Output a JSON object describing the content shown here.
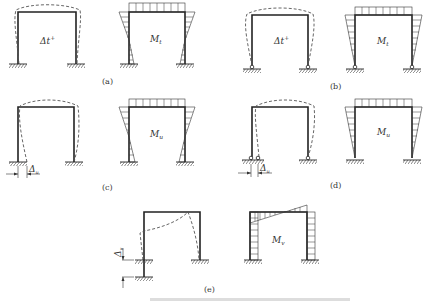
{
  "figure": {
    "panels": [
      {
        "id": "a",
        "caption": "(a)",
        "left_label": "Δt⁺",
        "right_label": "Mt",
        "support": "fixed",
        "case": "temperature change, fixed bases"
      },
      {
        "id": "b",
        "caption": "(b)",
        "left_label": "Δt⁺",
        "right_label": "Mt",
        "support": "pinned",
        "case": "temperature change, pinned bases"
      },
      {
        "id": "c",
        "caption": "(c)",
        "left_label": "Δu",
        "right_label": "Mu",
        "support": "fixed",
        "case": "horizontal support displacement, fixed bases"
      },
      {
        "id": "d",
        "caption": "(d)",
        "left_label": "Δu",
        "right_label": "Mu",
        "support": "pinned",
        "case": "horizontal support displacement, pinned bases"
      },
      {
        "id": "e",
        "caption": "(e)",
        "left_label": "Δv",
        "right_label": "Mv",
        "support": "fixed",
        "case": "vertical support settlement, fixed bases"
      }
    ],
    "bottom_caption": "(illegible faint caption text)"
  },
  "symbols": {
    "delta_t": "Δt",
    "plus": "+",
    "M": "M",
    "sub_t": "t",
    "sub_u": "u",
    "sub_v": "v",
    "delta": "Δ"
  }
}
